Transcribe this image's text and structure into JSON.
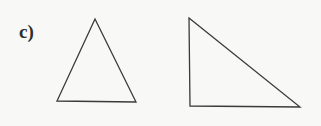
{
  "figure": {
    "label": "c)",
    "background_color": "#f8f8f6",
    "stroke_color": "#3a3a3a",
    "label_color": "#2e2e2e",
    "stroke_width": 1.3,
    "width": 321,
    "height": 126,
    "shapes": [
      {
        "name": "isosceles-triangle",
        "kind": "triangle",
        "points": "95,19 136,102 57,101",
        "vertices": [
          {
            "x": 95,
            "y": 19,
            "role": "apex"
          },
          {
            "x": 136,
            "y": 102,
            "role": "base-right"
          },
          {
            "x": 57,
            "y": 101,
            "role": "base-left"
          }
        ],
        "fill": "none"
      },
      {
        "name": "right-triangle",
        "kind": "triangle",
        "points": "189,18 300,107 190,106",
        "vertices": [
          {
            "x": 189,
            "y": 18,
            "role": "top-left"
          },
          {
            "x": 300,
            "y": 107,
            "role": "bottom-right"
          },
          {
            "x": 190,
            "y": 106,
            "role": "right-angle-corner"
          }
        ],
        "fill": "none"
      }
    ]
  }
}
